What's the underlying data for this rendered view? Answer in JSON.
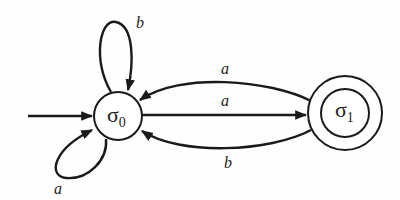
{
  "diagram": {
    "type": "finite-state-automaton",
    "colors": {
      "stroke": "#1a1a1a",
      "background": "#fefefe"
    },
    "states": [
      {
        "id": "s0",
        "symbol": "σ",
        "subscript": "0",
        "start": true,
        "accepting": false
      },
      {
        "id": "s1",
        "symbol": "σ",
        "subscript": "1",
        "start": false,
        "accepting": true
      }
    ],
    "transitions": [
      {
        "from": "s0",
        "to": "s0",
        "label": "b",
        "position": "self-loop-top"
      },
      {
        "from": "s0",
        "to": "s0",
        "label": "a",
        "position": "self-loop-bottom-left"
      },
      {
        "from": "s1",
        "to": "s0",
        "label": "a",
        "position": "upper-arc"
      },
      {
        "from": "s0",
        "to": "s1",
        "label": "a",
        "position": "straight-middle"
      },
      {
        "from": "s1",
        "to": "s0",
        "label": "b",
        "position": "lower-arc"
      }
    ]
  }
}
